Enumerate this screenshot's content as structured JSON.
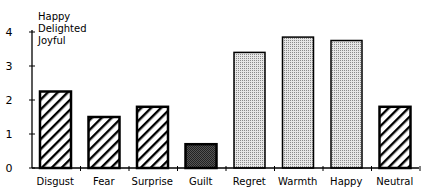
{
  "chart_data": {
    "type": "bar",
    "title": "",
    "xlabel": "",
    "ylabel": "",
    "ylim": [
      0,
      4
    ],
    "yticks": [
      0,
      1,
      2,
      3,
      4
    ],
    "grid": false,
    "legend": null,
    "annotations": [
      "Happy",
      "Delighted",
      "Joyful"
    ],
    "categories": [
      "Disgust",
      "Fear",
      "Surprise",
      "Guilt",
      "Regret",
      "Warmth",
      "Happy",
      "Neutral"
    ],
    "values": [
      2.25,
      1.5,
      1.8,
      0.7,
      3.4,
      3.85,
      3.75,
      1.8
    ],
    "fills": [
      "hatch",
      "hatch",
      "hatch",
      "dark-stipple",
      "light-stipple",
      "light-stipple",
      "light-stipple",
      "hatch"
    ]
  },
  "colors": {
    "axis": "#000000",
    "hatch": "#000000",
    "dark_stipple": "#3a3a3a",
    "light_stipple": "#c8c8c8"
  }
}
